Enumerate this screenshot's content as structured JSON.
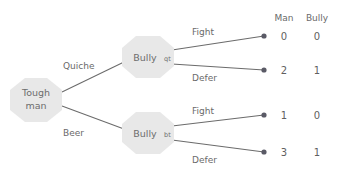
{
  "diagram": {
    "nodes": {
      "root": {
        "line1": "Tough",
        "line2": "man",
        "shape": "octagon"
      },
      "upper": {
        "base": "Bully",
        "subscript": "qt",
        "shape": "octagon"
      },
      "lower": {
        "base": "Bully",
        "subscript": "bt",
        "shape": "octagon"
      }
    },
    "edges": {
      "root_upper": "Quiche",
      "root_lower": "Beer",
      "upper_fight": "Fight",
      "upper_defer": "Defer",
      "lower_fight": "Fight",
      "lower_defer": "Defer"
    },
    "columns": {
      "man": "Man",
      "bully": "Bully"
    },
    "outcomes": [
      {
        "id": "quiche-fight",
        "man": "0",
        "bully": "0"
      },
      {
        "id": "quiche-defer",
        "man": "2",
        "bully": "1"
      },
      {
        "id": "beer-fight",
        "man": "1",
        "bully": "0"
      },
      {
        "id": "beer-defer",
        "man": "3",
        "bully": "1"
      }
    ],
    "colors": {
      "node_fill": "#e8e8e8",
      "line": "#6b6b6b",
      "text": "#6a6a6a",
      "dot": "#5a5a66",
      "background": "#ffffff"
    }
  }
}
